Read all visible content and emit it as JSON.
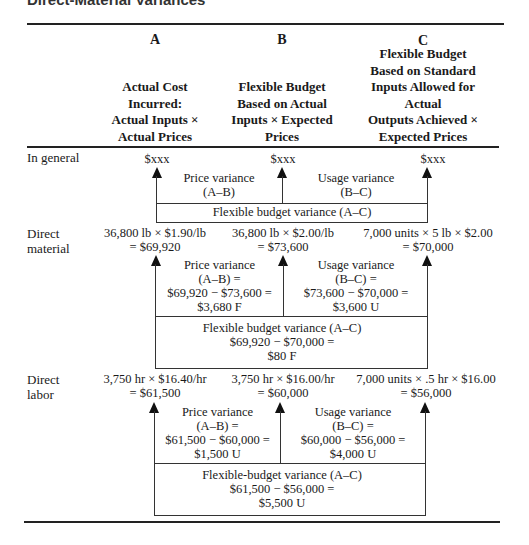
{
  "title": "Direct-Material Variances",
  "columns": [
    {
      "letter": "A",
      "heading": [
        "Actual Cost",
        "Incurred:",
        "Actual Inputs ×",
        "Actual Prices"
      ]
    },
    {
      "letter": "B",
      "heading": [
        "Flexible Budget",
        "Based on Actual",
        "Inputs × Expected",
        "Prices"
      ]
    },
    {
      "letter": "C",
      "heading": [
        "Flexible Budget",
        "Based on Standard",
        "Inputs Allowed for",
        "Actual",
        "Outputs Achieved ×",
        "Expected Prices"
      ]
    }
  ],
  "rows": {
    "general": {
      "label": "In general",
      "a": "$xxx",
      "b": "$xxx",
      "c": "$xxx",
      "price_variance": [
        "Price variance",
        "(A–B)"
      ],
      "usage_variance": [
        "Usage variance",
        "(B–C)"
      ],
      "flex_variance": [
        "Flexible budget variance (A–C)"
      ]
    },
    "material": {
      "label": [
        "Direct",
        "material"
      ],
      "a": [
        "36,800 lb × $1.90/lb",
        "= $69,920"
      ],
      "b": [
        "36,800 lb × $2.00/lb",
        "= $73,600"
      ],
      "c": [
        "7,000 units × 5 lb × $2.00",
        "= $70,000"
      ],
      "price_variance": [
        "Price variance",
        "(A–B) =",
        "$69,920 − $73,600 =",
        "$3,680 F"
      ],
      "usage_variance": [
        "Usage variance",
        "(B–C) =",
        "$73,600 − $70,000 =",
        "$3,600 U"
      ],
      "flex_variance": [
        "Flexible budget variance (A–C)",
        "$69,920 − $70,000 =",
        "$80 F"
      ]
    },
    "labor": {
      "label": [
        "Direct",
        "labor"
      ],
      "a": [
        "3,750 hr × $16.40/hr",
        "= $61,500"
      ],
      "b": [
        "3,750 hr × $16.00/hr",
        "= $60,000"
      ],
      "c": [
        "7,000 units × .5 hr × $16.00",
        "= $56,000"
      ],
      "price_variance": [
        "Price variance",
        "(A–B) =",
        "$61,500 − $60,000 =",
        "$1,500 U"
      ],
      "usage_variance": [
        "Usage variance",
        "(B–C) =",
        "$60,000 − $56,000 =",
        "$4,000 U"
      ],
      "flex_variance": [
        "Flexible-budget variance (A–C)",
        "$61,500 − $56,000 =",
        "$5,500 U"
      ]
    }
  }
}
